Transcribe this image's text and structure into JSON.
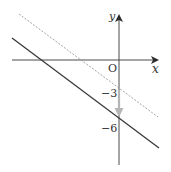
{
  "figure": {
    "axes": {
      "x_label": "x",
      "y_label": "y",
      "origin_label": "O"
    },
    "y_ticks": [
      {
        "value": -3,
        "label": "−3"
      },
      {
        "value": -6,
        "label": "−6"
      }
    ],
    "lines": [
      {
        "name": "original-line",
        "style": "dashed",
        "y_intercept": -3,
        "color": "#9a9a9a"
      },
      {
        "name": "translated-line",
        "style": "solid",
        "y_intercept": -6,
        "color": "#3a3a3a"
      }
    ],
    "translation_arrow": {
      "from": -3,
      "to": -6,
      "color": "#b5b5b5"
    },
    "colors": {
      "axis": "#4a4a4a",
      "dashed_line": "#9a9a9a",
      "solid_line": "#3a3a3a",
      "arrow": "#b5b5b5"
    }
  }
}
